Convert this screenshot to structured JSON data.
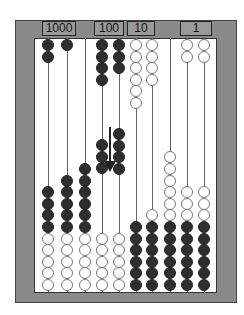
{
  "labels": [
    {
      "text": "1000",
      "left": 42,
      "width": 34
    },
    {
      "text": "100",
      "left": 94,
      "width": 30
    },
    {
      "text": "10",
      "left": 127,
      "width": 28
    },
    {
      "text": "1",
      "left": 180,
      "width": 32
    }
  ],
  "rods": [
    {
      "x": 48,
      "top": [
        [
          "black",
          2
        ]
      ],
      "middle": [],
      "bottom": [
        [
          "black",
          4
        ],
        [
          "white",
          5
        ]
      ]
    },
    {
      "x": 67,
      "top": [
        [
          "black",
          1
        ]
      ],
      "middle": [],
      "bottom": [
        [
          "black",
          5
        ],
        [
          "white",
          5
        ]
      ]
    },
    {
      "x": 85,
      "top": [],
      "middle": [],
      "bottom": [
        [
          "black",
          6
        ],
        [
          "white",
          5
        ]
      ]
    },
    {
      "x": 102,
      "top": [
        [
          "black",
          4
        ]
      ],
      "middle": [
        [
          "black",
          3
        ]
      ],
      "bottom": [
        [
          "white",
          5
        ]
      ]
    },
    {
      "x": 119,
      "top": [
        [
          "black",
          3
        ]
      ],
      "middle": [
        [
          "black",
          4
        ]
      ],
      "bottom": [
        [
          "white",
          5
        ]
      ]
    },
    {
      "x": 136,
      "top": [
        [
          "white",
          6
        ]
      ],
      "middle": [],
      "bottom": [
        [
          "black",
          6
        ]
      ]
    },
    {
      "x": 152,
      "top": [
        [
          "white",
          4
        ]
      ],
      "middle": [],
      "bottom": [
        [
          "white",
          1
        ],
        [
          "black",
          6
        ]
      ]
    },
    {
      "x": 170,
      "top": [],
      "middle": [],
      "bottom": [
        [
          "white",
          6
        ],
        [
          "black",
          6
        ]
      ]
    },
    {
      "x": 187,
      "top": [
        [
          "white",
          2
        ]
      ],
      "middle": [],
      "bottom": [
        [
          "white",
          3
        ],
        [
          "black",
          6
        ]
      ]
    },
    {
      "x": 204,
      "top": [
        [
          "white",
          2
        ]
      ],
      "middle": [],
      "bottom": [
        [
          "white",
          3
        ],
        [
          "black",
          6
        ]
      ]
    }
  ],
  "arrow": {
    "direction": "down"
  }
}
